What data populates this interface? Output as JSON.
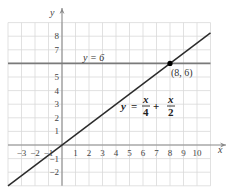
{
  "chart_data": {
    "type": "line",
    "title": "",
    "xlabel": "x",
    "ylabel": "y",
    "xlim": [
      -4,
      11
    ],
    "ylim": [
      -3,
      9
    ],
    "grid": true,
    "x_ticks": [
      -3,
      -2,
      -1,
      1,
      2,
      3,
      4,
      5,
      6,
      7,
      8,
      9,
      10
    ],
    "y_ticks": [
      -2,
      -1,
      1,
      2,
      3,
      4,
      5,
      7,
      8
    ],
    "x_tick_labels": [
      "−3",
      "−2",
      "−1",
      "1",
      "2",
      "3",
      "4",
      "5",
      "6",
      "7",
      "8",
      "9",
      "10"
    ],
    "y_tick_labels": [
      "−2",
      "−1",
      "1",
      "2",
      "3",
      "4",
      "5",
      "7",
      "8"
    ],
    "series": [
      {
        "name": "y = 6",
        "kind": "horizontal-line",
        "x": [
          -4,
          11
        ],
        "y": [
          6,
          6
        ],
        "color": "#7a7a7a"
      },
      {
        "name": "y = x/4 + x/2",
        "kind": "line",
        "x": [
          -4,
          11
        ],
        "y": [
          -3,
          8.25
        ],
        "color": "#2b2b2b"
      }
    ],
    "points": [
      {
        "x": 8,
        "y": 6,
        "label": "(8, 6)"
      }
    ],
    "annotations": [
      {
        "text": "y = 6",
        "x": 2.6,
        "y": 6.3
      },
      {
        "text": "y = x/4 + x/2",
        "x": 5.7,
        "y": 3.3
      },
      {
        "text": "(8, 6)",
        "x": 8.2,
        "y": 5.3
      }
    ]
  },
  "labels": {
    "y_axis": "y",
    "x_axis": "x",
    "hline_label": "y = 6",
    "point_label": "(8, 6)",
    "eq_y": "y",
    "eq_equals": "=",
    "eq_num1": "x",
    "eq_den1": "4",
    "eq_plus": "+",
    "eq_num2": "x",
    "eq_den2": "2"
  },
  "colors": {
    "grid": "#d9d9d9",
    "axis": "#8a8a8a",
    "hline": "#7a7a7a",
    "line": "#2b2b2b",
    "point": "#000000",
    "text": "#444444"
  }
}
